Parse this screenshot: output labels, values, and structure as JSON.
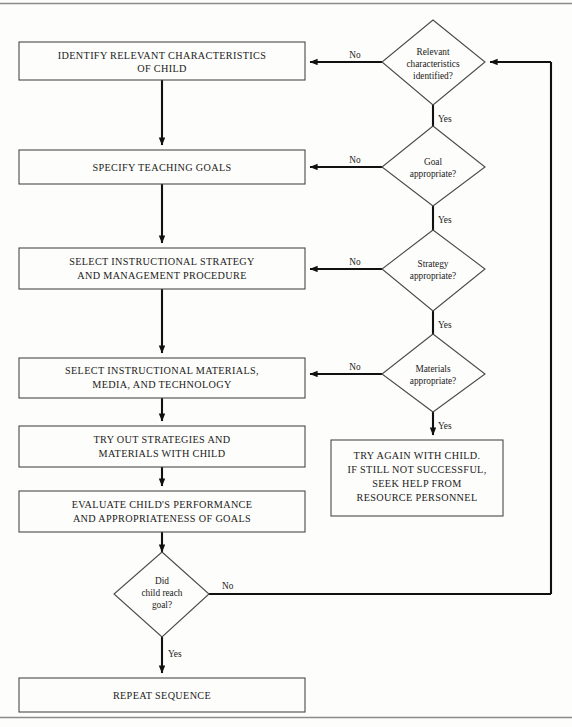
{
  "diagram": {
    "canvas": {
      "width": 572,
      "height": 727
    },
    "colors": {
      "background": "#fdfdfb",
      "node_stroke": "#4a4a4a",
      "line": "#111111",
      "text": "#1a1a1a",
      "frame_rule": "#8b8b8b"
    },
    "process_boxes": [
      {
        "id": "identify",
        "lines": [
          "IDENTIFY RELEVANT CHARACTERISTICS",
          "OF CHILD"
        ]
      },
      {
        "id": "goals",
        "lines": [
          "SPECIFY TEACHING GOALS"
        ]
      },
      {
        "id": "strategy",
        "lines": [
          "SELECT INSTRUCTIONAL STRATEGY",
          "AND MANAGEMENT PROCEDURE"
        ]
      },
      {
        "id": "materials",
        "lines": [
          "SELECT INSTRUCTIONAL MATERIALS,",
          "MEDIA, AND TECHNOLOGY"
        ]
      },
      {
        "id": "tryout",
        "lines": [
          "TRY OUT STRATEGIES AND",
          "MATERIALS WITH CHILD"
        ]
      },
      {
        "id": "evaluate",
        "lines": [
          "EVALUATE CHILD'S PERFORMANCE",
          "AND APPROPRIATENESS OF GOALS"
        ]
      },
      {
        "id": "repeat",
        "lines": [
          "REPEAT SEQUENCE"
        ]
      },
      {
        "id": "tryagain",
        "lines": [
          "TRY AGAIN WITH CHILD.",
          "IF STILL NOT SUCCESSFUL,",
          "SEEK HELP FROM",
          "RESOURCE PERSONNEL"
        ]
      }
    ],
    "decisions": [
      {
        "id": "d-relevant",
        "lines": [
          "Relevant",
          "characteristics",
          "identified?"
        ]
      },
      {
        "id": "d-goal",
        "lines": [
          "Goal",
          "appropriate?"
        ]
      },
      {
        "id": "d-strategy",
        "lines": [
          "Strategy",
          "appropriate?"
        ]
      },
      {
        "id": "d-materials",
        "lines": [
          "Materials",
          "appropriate?"
        ]
      },
      {
        "id": "d-reachgoal",
        "lines": [
          "Did",
          "child reach",
          "goal?"
        ]
      }
    ],
    "edge_labels": {
      "no_relevant": "No",
      "yes_relevant": "Yes",
      "no_goal": "No",
      "yes_goal": "Yes",
      "no_strategy": "No",
      "yes_strategy": "Yes",
      "no_materials": "No",
      "yes_materials": "Yes",
      "no_reachgoal": "No",
      "yes_reachgoal": "Yes"
    }
  }
}
